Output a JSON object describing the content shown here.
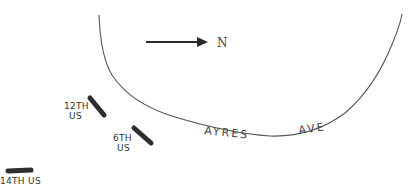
{
  "map": {
    "north_label": "N",
    "street": {
      "name_part1": "AYRES",
      "name_part2": "AVE"
    },
    "markers": [
      {
        "line1": "12TH",
        "line2": "US"
      },
      {
        "line1": "6TH",
        "line2": "US"
      },
      {
        "line1": "14TH US"
      }
    ],
    "colors": {
      "line": "#555555",
      "marker": "#2e2e2e",
      "arrow": "#2a2a2a"
    }
  }
}
